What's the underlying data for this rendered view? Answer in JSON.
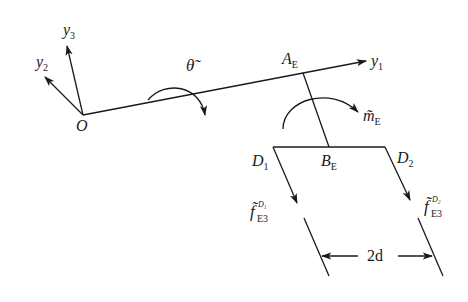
{
  "diagram": {
    "labels": {
      "origin": "O",
      "axis_y1": "y",
      "axis_y1_sub": "1",
      "axis_y2": "y",
      "axis_y2_sub": "2",
      "axis_y3": "y",
      "axis_y3_sub": "3",
      "theta": "θ̃",
      "point_A": "A",
      "point_A_sub": "E",
      "point_B": "B",
      "point_B_sub": "E",
      "point_D1": "D",
      "point_D1_sub": "1",
      "point_D2": "D",
      "point_D2_sub": "2",
      "moment": "m̃",
      "moment_sub": "E",
      "force1": "f̃",
      "force1_sub": "E3",
      "force1_sup": "D₁",
      "force2": "f̃",
      "force2_sub": "E3",
      "force2_sup": "D₂",
      "dimension": "2d"
    }
  }
}
